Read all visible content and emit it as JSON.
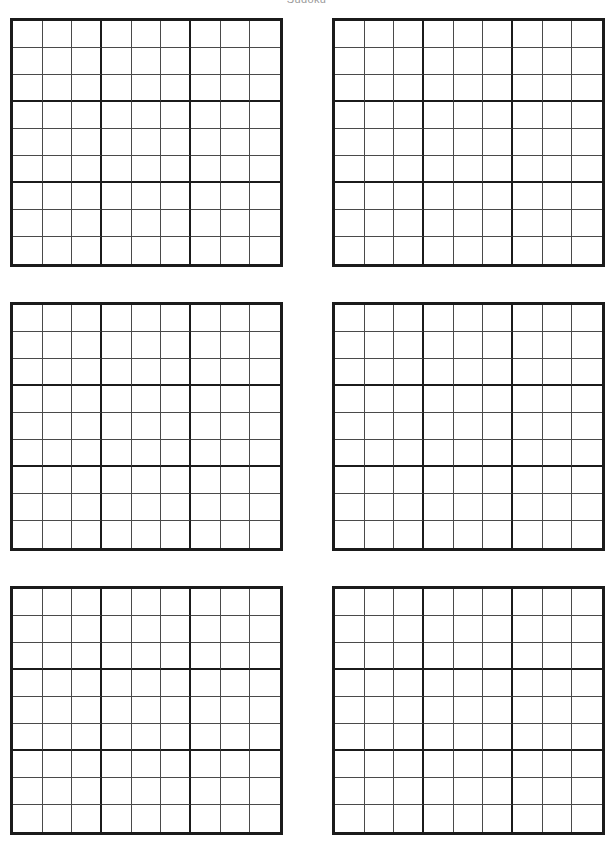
{
  "page": {
    "title": "Sudoku",
    "background_color": "#ffffff",
    "width": 613,
    "height": 850
  },
  "style": {
    "grid_border_color": "#1b1b1b",
    "cell_line_color": "#4a4a4a",
    "cell_fill_color": "#ffffff"
  },
  "puzzle_sheet": {
    "columns": 2,
    "rows": 3,
    "grid_count": 6,
    "grid_size": 9,
    "block_size": 3,
    "grids": [
      {
        "label": "puzzle-1",
        "position": "top-left",
        "cells": [
          [
            "",
            "",
            "",
            "",
            "",
            "",
            "",
            "",
            ""
          ],
          [
            "",
            "",
            "",
            "",
            "",
            "",
            "",
            "",
            ""
          ],
          [
            "",
            "",
            "",
            "",
            "",
            "",
            "",
            "",
            ""
          ],
          [
            "",
            "",
            "",
            "",
            "",
            "",
            "",
            "",
            ""
          ],
          [
            "",
            "",
            "",
            "",
            "",
            "",
            "",
            "",
            ""
          ],
          [
            "",
            "",
            "",
            "",
            "",
            "",
            "",
            "",
            ""
          ],
          [
            "",
            "",
            "",
            "",
            "",
            "",
            "",
            "",
            ""
          ],
          [
            "",
            "",
            "",
            "",
            "",
            "",
            "",
            "",
            ""
          ],
          [
            "",
            "",
            "",
            "",
            "",
            "",
            "",
            "",
            ""
          ]
        ]
      },
      {
        "label": "puzzle-2",
        "position": "top-right",
        "cells": [
          [
            "",
            "",
            "",
            "",
            "",
            "",
            "",
            "",
            ""
          ],
          [
            "",
            "",
            "",
            "",
            "",
            "",
            "",
            "",
            ""
          ],
          [
            "",
            "",
            "",
            "",
            "",
            "",
            "",
            "",
            ""
          ],
          [
            "",
            "",
            "",
            "",
            "",
            "",
            "",
            "",
            ""
          ],
          [
            "",
            "",
            "",
            "",
            "",
            "",
            "",
            "",
            ""
          ],
          [
            "",
            "",
            "",
            "",
            "",
            "",
            "",
            "",
            ""
          ],
          [
            "",
            "",
            "",
            "",
            "",
            "",
            "",
            "",
            ""
          ],
          [
            "",
            "",
            "",
            "",
            "",
            "",
            "",
            "",
            ""
          ],
          [
            "",
            "",
            "",
            "",
            "",
            "",
            "",
            "",
            ""
          ]
        ]
      },
      {
        "label": "puzzle-3",
        "position": "middle-left",
        "cells": [
          [
            "",
            "",
            "",
            "",
            "",
            "",
            "",
            "",
            ""
          ],
          [
            "",
            "",
            "",
            "",
            "",
            "",
            "",
            "",
            ""
          ],
          [
            "",
            "",
            "",
            "",
            "",
            "",
            "",
            "",
            ""
          ],
          [
            "",
            "",
            "",
            "",
            "",
            "",
            "",
            "",
            ""
          ],
          [
            "",
            "",
            "",
            "",
            "",
            "",
            "",
            "",
            ""
          ],
          [
            "",
            "",
            "",
            "",
            "",
            "",
            "",
            "",
            ""
          ],
          [
            "",
            "",
            "",
            "",
            "",
            "",
            "",
            "",
            ""
          ],
          [
            "",
            "",
            "",
            "",
            "",
            "",
            "",
            "",
            ""
          ],
          [
            "",
            "",
            "",
            "",
            "",
            "",
            "",
            "",
            ""
          ]
        ]
      },
      {
        "label": "puzzle-4",
        "position": "middle-right",
        "cells": [
          [
            "",
            "",
            "",
            "",
            "",
            "",
            "",
            "",
            ""
          ],
          [
            "",
            "",
            "",
            "",
            "",
            "",
            "",
            "",
            ""
          ],
          [
            "",
            "",
            "",
            "",
            "",
            "",
            "",
            "",
            ""
          ],
          [
            "",
            "",
            "",
            "",
            "",
            "",
            "",
            "",
            ""
          ],
          [
            "",
            "",
            "",
            "",
            "",
            "",
            "",
            "",
            ""
          ],
          [
            "",
            "",
            "",
            "",
            "",
            "",
            "",
            "",
            ""
          ],
          [
            "",
            "",
            "",
            "",
            "",
            "",
            "",
            "",
            ""
          ],
          [
            "",
            "",
            "",
            "",
            "",
            "",
            "",
            "",
            ""
          ],
          [
            "",
            "",
            "",
            "",
            "",
            "",
            "",
            "",
            ""
          ]
        ]
      },
      {
        "label": "puzzle-5",
        "position": "bottom-left",
        "cells": [
          [
            "",
            "",
            "",
            "",
            "",
            "",
            "",
            "",
            ""
          ],
          [
            "",
            "",
            "",
            "",
            "",
            "",
            "",
            "",
            ""
          ],
          [
            "",
            "",
            "",
            "",
            "",
            "",
            "",
            "",
            ""
          ],
          [
            "",
            "",
            "",
            "",
            "",
            "",
            "",
            "",
            ""
          ],
          [
            "",
            "",
            "",
            "",
            "",
            "",
            "",
            "",
            ""
          ],
          [
            "",
            "",
            "",
            "",
            "",
            "",
            "",
            "",
            ""
          ],
          [
            "",
            "",
            "",
            "",
            "",
            "",
            "",
            "",
            ""
          ],
          [
            "",
            "",
            "",
            "",
            "",
            "",
            "",
            "",
            ""
          ],
          [
            "",
            "",
            "",
            "",
            "",
            "",
            "",
            "",
            ""
          ]
        ]
      },
      {
        "label": "puzzle-6",
        "position": "bottom-right",
        "cells": [
          [
            "",
            "",
            "",
            "",
            "",
            "",
            "",
            "",
            ""
          ],
          [
            "",
            "",
            "",
            "",
            "",
            "",
            "",
            "",
            ""
          ],
          [
            "",
            "",
            "",
            "",
            "",
            "",
            "",
            "",
            ""
          ],
          [
            "",
            "",
            "",
            "",
            "",
            "",
            "",
            "",
            ""
          ],
          [
            "",
            "",
            "",
            "",
            "",
            "",
            "",
            "",
            ""
          ],
          [
            "",
            "",
            "",
            "",
            "",
            "",
            "",
            "",
            ""
          ],
          [
            "",
            "",
            "",
            "",
            "",
            "",
            "",
            "",
            ""
          ],
          [
            "",
            "",
            "",
            "",
            "",
            "",
            "",
            "",
            ""
          ],
          [
            "",
            "",
            "",
            "",
            "",
            "",
            "",
            "",
            ""
          ]
        ]
      }
    ]
  }
}
